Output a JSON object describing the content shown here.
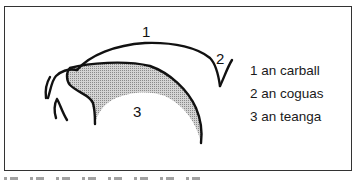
{
  "diagram": {
    "labels": {
      "upper": "1",
      "back": "2",
      "tongue": "3"
    },
    "legend": [
      {
        "number": "1",
        "text": "an carball"
      },
      {
        "number": "2",
        "text": "an coguas"
      },
      {
        "number": "3",
        "text": "an teanga"
      }
    ],
    "colors": {
      "stroke": "#111111",
      "hatch": "#b0b0b0",
      "frame": "#333333"
    }
  }
}
